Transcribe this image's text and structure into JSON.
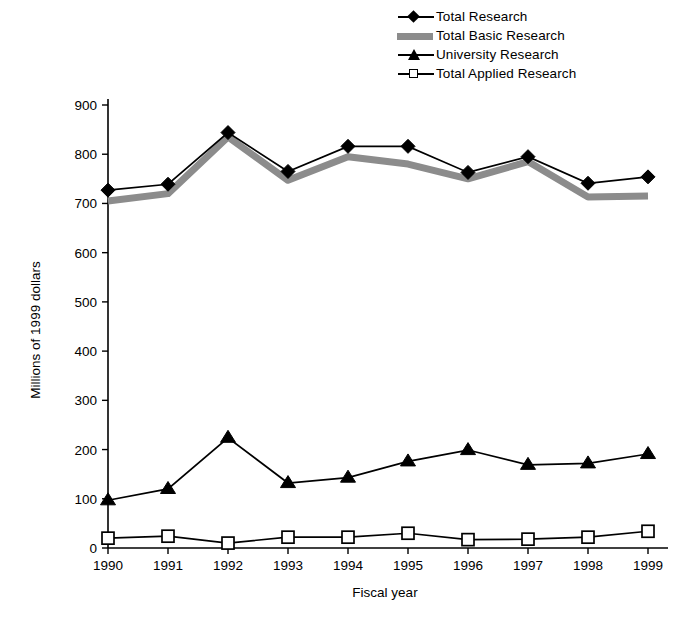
{
  "chart_data": {
    "type": "line",
    "title": "",
    "xlabel": "Fiscal year",
    "ylabel": "Millions of 1999 dollars",
    "categories": [
      "1990",
      "1991",
      "1992",
      "1993",
      "1994",
      "1995",
      "1996",
      "1997",
      "1998",
      "1999"
    ],
    "x": [
      1990,
      1991,
      1992,
      1993,
      1994,
      1995,
      1996,
      1997,
      1998,
      1999
    ],
    "xlim": [
      1990,
      1999
    ],
    "ylim": [
      0,
      900
    ],
    "yticks": [
      0,
      100,
      200,
      300,
      400,
      500,
      600,
      700,
      800,
      900
    ],
    "grid": false,
    "legend_position": "top-right",
    "series": [
      {
        "name": "Total Research",
        "marker": "filled-diamond",
        "color": "#000000",
        "values": [
          727,
          739,
          844,
          765,
          816,
          816,
          763,
          795,
          741,
          754
        ]
      },
      {
        "name": "Total Basic Research",
        "marker": "gray-band",
        "color": "#8c8c8c",
        "values": [
          705,
          720,
          835,
          747,
          795,
          780,
          750,
          785,
          713,
          715
        ]
      },
      {
        "name": "University Research",
        "marker": "filled-triangle",
        "color": "#000000",
        "values": [
          97,
          120,
          224,
          132,
          143,
          176,
          199,
          169,
          172,
          191
        ]
      },
      {
        "name": "Total Applied Research",
        "marker": "open-square",
        "color": "#000000",
        "values": [
          20,
          24,
          10,
          22,
          22,
          30,
          17,
          18,
          22,
          34
        ]
      }
    ]
  },
  "legend": {
    "items": [
      {
        "label": "Total Research",
        "key": "line-diamond-key-icon"
      },
      {
        "label": "Total Basic Research",
        "key": "gray-band-key-icon"
      },
      {
        "label": "University Research",
        "key": "line-triangle-key-icon"
      },
      {
        "label": "Total Applied Research",
        "key": "line-square-key-icon"
      }
    ]
  },
  "axes": {
    "y_title": "Millions of 1999 dollars",
    "x_title": "Fiscal year",
    "y_tick_labels": [
      "900",
      "800",
      "700",
      "600",
      "500",
      "400",
      "300",
      "200",
      "100",
      "0"
    ],
    "x_tick_labels": [
      "1990",
      "1991",
      "1992",
      "1993",
      "1994",
      "1995",
      "1996",
      "1997",
      "1998",
      "1999"
    ]
  }
}
